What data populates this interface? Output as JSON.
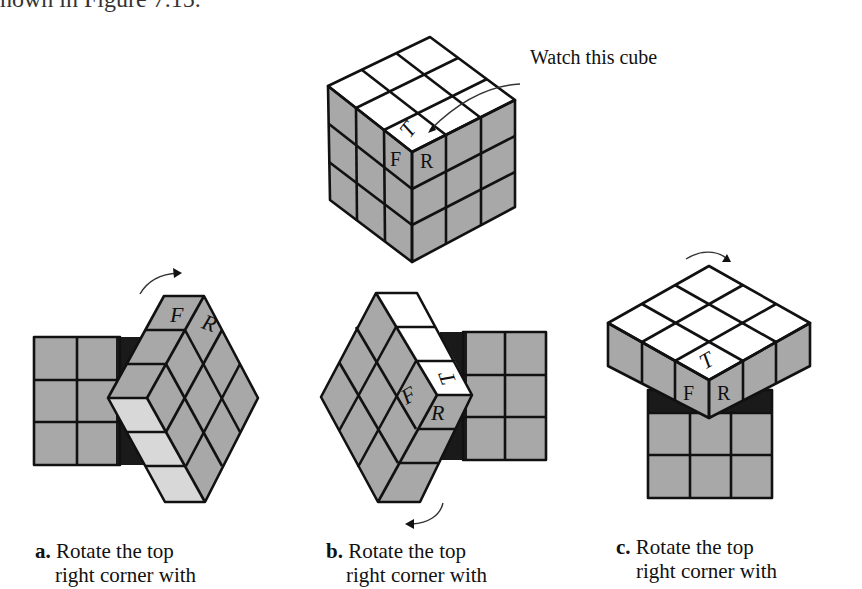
{
  "page": {
    "top_fragment": "hown in Figure 7.15."
  },
  "figure": {
    "callout": "Watch this cube",
    "main_cube_labels": {
      "top": "T",
      "front": "F",
      "right": "R"
    },
    "panel_a": {
      "labels": {
        "front": "F",
        "right": "R"
      }
    },
    "panel_b": {
      "labels": {
        "top": "T",
        "front": "F",
        "right": "R"
      }
    },
    "panel_c": {
      "labels": {
        "top": "T",
        "front": "F",
        "right": "R"
      }
    },
    "captions": [
      {
        "letter": "a.",
        "line1": "Rotate the top",
        "line2": "right corner with"
      },
      {
        "letter": "b.",
        "line1": "Rotate the top",
        "line2": "right corner with"
      },
      {
        "letter": "c.",
        "line1": "Rotate the top",
        "line2": "right corner with"
      }
    ],
    "colors": {
      "gray": "#a8a8a8",
      "white": "#ffffff",
      "light": "#d8d8d8",
      "dark": "#1a1a1a"
    }
  }
}
